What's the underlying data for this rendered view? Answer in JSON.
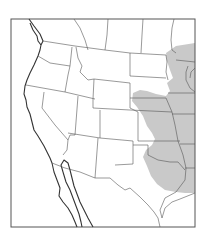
{
  "map": {
    "type": "species-range-map",
    "region": "Western and Central United States with northern Mexico",
    "shaded_region_label": "range",
    "colors": {
      "background": "#ffffff",
      "range_fill": "#c9c9c9",
      "lines": "#444444"
    },
    "frame": {
      "x": 11,
      "y": 19,
      "width": 184,
      "height": 208
    }
  }
}
